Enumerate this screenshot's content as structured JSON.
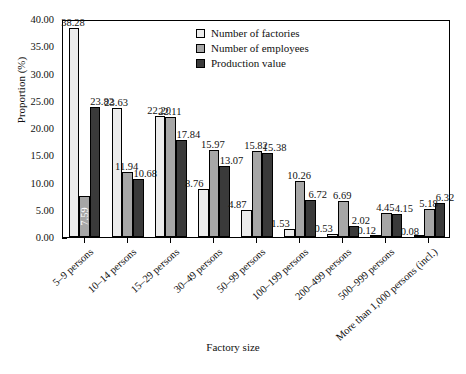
{
  "chart_data": {
    "type": "bar",
    "title": "",
    "xlabel": "Factory size",
    "ylabel": "Proportion (%)",
    "ylim": [
      0,
      40
    ],
    "ytick_step": 5,
    "ytick_labels": [
      "0.00",
      "5.00",
      "10.00",
      "15.00",
      "20.00",
      "25.00",
      "30.00",
      "35.00",
      "40.00"
    ],
    "grid": false,
    "legend_position": "top-center",
    "categories": [
      "5–9 persons",
      "10–14 persons",
      "15–29 persons",
      "30–49 persons",
      "50–99 persons",
      "100–199 persons",
      "200–499 persons",
      "500–999 persons",
      "More than 1,000 persons (incl.)"
    ],
    "series": [
      {
        "name": "Number of factories",
        "color": "#ececec",
        "values": [
          38.28,
          23.63,
          22.2,
          8.76,
          4.87,
          1.53,
          0.53,
          0.12,
          0.08
        ],
        "labels": [
          "38.28",
          "23.63",
          "22.20",
          "8.76",
          "4.87",
          "1.53",
          "0.53",
          "0.12",
          "0.08"
        ]
      },
      {
        "name": "Number of employees",
        "color": "#a6a6a6",
        "values": [
          7.59,
          11.94,
          22.11,
          15.97,
          15.82,
          10.26,
          6.69,
          4.45,
          5.18
        ],
        "labels": [
          "7.59",
          "11.94",
          "22.11",
          "15.97",
          "15.82",
          "10.26",
          "6.69",
          "4.45",
          "5.18"
        ]
      },
      {
        "name": "Production value",
        "color": "#3a3a3a",
        "values": [
          23.82,
          10.68,
          17.84,
          13.07,
          15.38,
          6.72,
          2.02,
          4.15,
          6.32
        ],
        "labels": [
          "23.82",
          "10.68",
          "17.84",
          "13.07",
          "15.38",
          "6.72",
          "2.02",
          "4.15",
          "6.32"
        ]
      }
    ]
  },
  "legend": {
    "items": [
      {
        "label": "Number of factories"
      },
      {
        "label": "Number of employees"
      },
      {
        "label": "Production value"
      }
    ]
  }
}
